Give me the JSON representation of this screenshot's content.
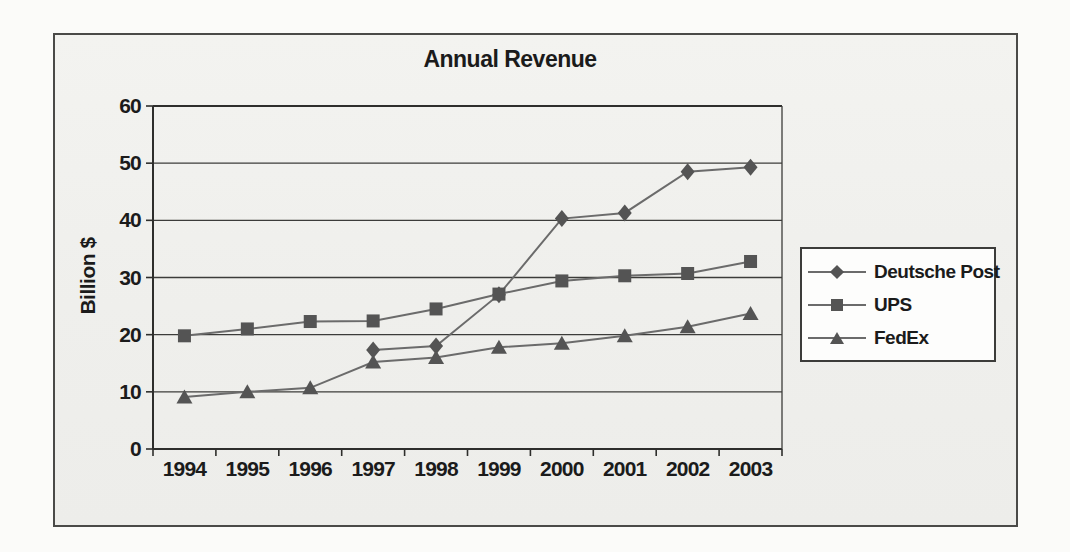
{
  "page": {
    "background_color": "#fbfbf9",
    "frame_border_color": "#4a4a48",
    "paper_color": "#f1f1ee"
  },
  "chart_data": {
    "type": "line",
    "title": "Annual Revenue",
    "xlabel": "",
    "ylabel": "Billion $",
    "categories": [
      "1994",
      "1995",
      "1996",
      "1997",
      "1998",
      "1999",
      "2000",
      "2001",
      "2002",
      "2003"
    ],
    "series": [
      {
        "name": "Deutsche Post",
        "marker": "diamond",
        "values": [
          null,
          null,
          null,
          17.3,
          18.0,
          27.0,
          40.3,
          41.3,
          48.5,
          49.3
        ]
      },
      {
        "name": "UPS",
        "marker": "square",
        "values": [
          19.8,
          21.0,
          22.3,
          22.4,
          24.5,
          27.1,
          29.4,
          30.3,
          30.7,
          32.8
        ]
      },
      {
        "name": "FedEx",
        "marker": "triangle",
        "values": [
          9.1,
          10.0,
          10.7,
          15.2,
          16.0,
          17.8,
          18.5,
          19.8,
          21.4,
          23.7
        ]
      }
    ],
    "ylim": [
      0,
      60
    ],
    "yticks": [
      0,
      10,
      20,
      30,
      40,
      50,
      60
    ],
    "grid": true,
    "legend_position": "right",
    "colors": {
      "marker_fill": "#545454",
      "series_line": "#6b6b6b",
      "gridline": "#3c3c3a",
      "axis_line": "#2e2e2c",
      "text": "#1b1b1b"
    }
  }
}
